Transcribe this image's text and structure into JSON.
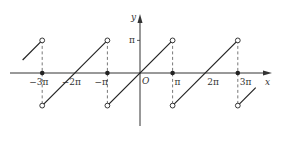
{
  "chart_data": {
    "type": "line",
    "title": "",
    "xlabel": "x",
    "ylabel": "y",
    "origin_label": "O",
    "x_unit": "pi",
    "xlim": [
      -3.7,
      3.7
    ],
    "ylim": [
      -1.4,
      1.9
    ],
    "x_ticks": [
      {
        "value": -3,
        "label": "−3π"
      },
      {
        "value": -2,
        "label": "−2π"
      },
      {
        "value": -1,
        "label": "−π"
      },
      {
        "value": 1,
        "label": "π"
      },
      {
        "value": 2,
        "label": "2π"
      },
      {
        "value": 3,
        "label": "3π"
      }
    ],
    "y_ticks": [
      {
        "value": 1,
        "label": "π"
      }
    ],
    "segments": [
      {
        "x": [
          -3.6,
          -3
        ],
        "y": [
          0.4,
          1
        ],
        "start_open": false,
        "end_open": true
      },
      {
        "x": [
          -3,
          -1
        ],
        "y": [
          -1,
          1
        ],
        "start_open": true,
        "end_open": true
      },
      {
        "x": [
          -1,
          1
        ],
        "y": [
          -1,
          1
        ],
        "start_open": true,
        "end_open": true
      },
      {
        "x": [
          1,
          3
        ],
        "y": [
          -1,
          1
        ],
        "start_open": true,
        "end_open": true
      },
      {
        "x": [
          3,
          3.55
        ],
        "y": [
          -1,
          -0.45
        ],
        "start_open": true,
        "end_open": false
      }
    ],
    "filled_points": [
      {
        "x": -3,
        "y": 0
      },
      {
        "x": -1,
        "y": 0
      },
      {
        "x": 1,
        "y": 0
      },
      {
        "x": 3,
        "y": 0
      }
    ],
    "dashed_verticals": [
      -3,
      -1,
      1,
      3
    ],
    "colors": {
      "line": "#222222",
      "axis": "#333333",
      "dashed": "#555555"
    }
  }
}
